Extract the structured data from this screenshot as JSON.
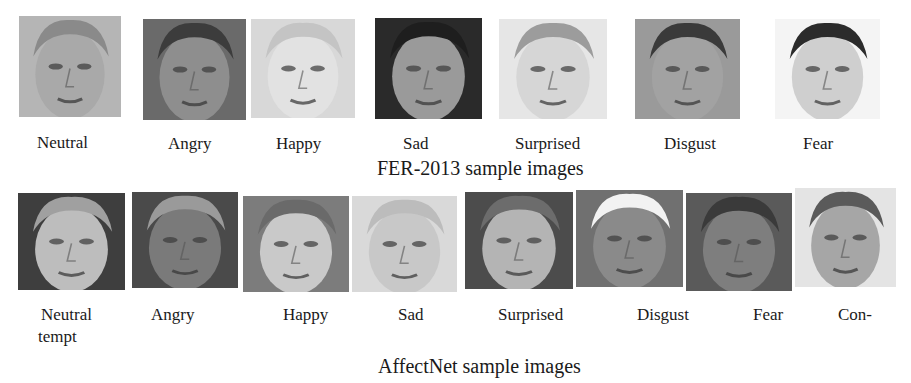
{
  "figure": {
    "fer2013": {
      "caption": "FER-2013 sample images",
      "samples": [
        {
          "label": "Neutral",
          "tone": "#a9a9a9",
          "hair": "#8a8a8a",
          "bg": "#b5b5b5"
        },
        {
          "label": "Angry",
          "tone": "#8e8e8e",
          "hair": "#3c3c3c",
          "bg": "#6a6a6a"
        },
        {
          "label": "Happy",
          "tone": "#e2e2e2",
          "hair": "#c4c4c4",
          "bg": "#d8d8d8"
        },
        {
          "label": "Sad",
          "tone": "#9a9a9a",
          "hair": "#1e1e1e",
          "bg": "#2a2a2a"
        },
        {
          "label": "Surprised",
          "tone": "#d6d6d6",
          "hair": "#9c9c9c",
          "bg": "#e6e6e6"
        },
        {
          "label": "Disgust",
          "tone": "#a2a2a2",
          "hair": "#3a3a3a",
          "bg": "#9a9a9a"
        },
        {
          "label": "Fear",
          "tone": "#cfcfcf",
          "hair": "#2b2b2b",
          "bg": "#f4f4f4"
        }
      ]
    },
    "affectnet": {
      "caption": "AffectNet sample images",
      "samples": [
        {
          "label": "Neutral",
          "tone": "#bdbdbd",
          "hair": "#a0a0a0",
          "bg": "#3e3e3e"
        },
        {
          "label": "Angry",
          "tone": "#7a7a7a",
          "hair": "#9a9a9a",
          "bg": "#4a4a4a"
        },
        {
          "label": "Happy",
          "tone": "#c9c9c9",
          "hair": "#6a6a6a",
          "bg": "#7c7c7c"
        },
        {
          "label": "Sad",
          "tone": "#c8c8c8",
          "hair": "#bcbcbc",
          "bg": "#d9d9d9"
        },
        {
          "label": "Surprised",
          "tone": "#b4b4b4",
          "hair": "#6c6c6c",
          "bg": "#4c4c4c"
        },
        {
          "label": "Disgust",
          "tone": "#8a8a8a",
          "hair": "#f2f2f2",
          "bg": "#707070"
        },
        {
          "label": "Fear",
          "tone": "#7e7e7e",
          "hair": "#3a3a3a",
          "bg": "#5a5a5a"
        },
        {
          "label": "Con-",
          "tone": "#a6a6a6",
          "hair": "#5a5a5a",
          "bg": "#e4e4e4"
        }
      ],
      "label_overflow": "tempt"
    }
  }
}
